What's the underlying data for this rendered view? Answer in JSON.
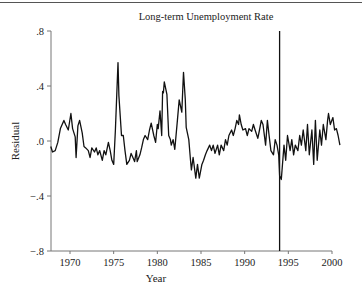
{
  "chart_data": {
    "type": "line",
    "title": "Long-term Unemployment Rate",
    "xlabel": "Year",
    "ylabel": "Residual",
    "xlim": [
      1967.7,
      2001.0
    ],
    "ylim": [
      -0.8,
      0.8
    ],
    "x_ticks": [
      1970,
      1975,
      1980,
      1985,
      1990,
      1995,
      2000
    ],
    "x_tick_labels": [
      "1970",
      "1975",
      "1980",
      "1985",
      "1990",
      "1995",
      "2000"
    ],
    "y_ticks": [
      0.8,
      0.4,
      0.0,
      -0.4,
      -0.8
    ],
    "y_tick_labels": [
      ".8",
      ".4",
      ".0",
      "−.4",
      "−.8"
    ],
    "grid": false,
    "legend": null,
    "annotations": [
      {
        "type": "vertical_line",
        "x": 1994.0,
        "description": "break marker"
      }
    ],
    "series": [
      {
        "name": "Residual",
        "color": "#111111",
        "x": [
          1967.8,
          1968.0,
          1968.3,
          1968.6,
          1968.9,
          1969.3,
          1969.5,
          1969.8,
          1970.1,
          1970.3,
          1970.6,
          1970.7,
          1970.9,
          1971.1,
          1971.4,
          1971.6,
          1971.8,
          1972.1,
          1972.3,
          1972.5,
          1972.8,
          1973.0,
          1973.2,
          1973.4,
          1973.7,
          1973.9,
          1974.1,
          1974.4,
          1974.6,
          1974.8,
          1975.0,
          1975.2,
          1975.5,
          1975.6,
          1975.9,
          1976.1,
          1976.3,
          1976.5,
          1976.8,
          1977.0,
          1977.2,
          1977.4,
          1977.6,
          1977.7,
          1978.0,
          1978.2,
          1978.4,
          1978.6,
          1978.9,
          1979.1,
          1979.3,
          1979.6,
          1979.8,
          1980.0,
          1980.1,
          1980.3,
          1980.5,
          1980.6,
          1980.7,
          1980.8,
          1981.1,
          1981.3,
          1981.5,
          1981.6,
          1981.8,
          1982.0,
          1982.3,
          1982.5,
          1982.8,
          1983.0,
          1983.2,
          1983.3,
          1983.6,
          1983.8,
          1983.9,
          1984.1,
          1984.4,
          1984.6,
          1984.8,
          1985.1,
          1985.3,
          1985.5,
          1985.7,
          1986.0,
          1986.2,
          1986.4,
          1986.6,
          1986.9,
          1987.1,
          1987.3,
          1987.6,
          1987.8,
          1988.0,
          1988.2,
          1988.5,
          1988.7,
          1988.9,
          1989.1,
          1989.3,
          1989.4,
          1989.6,
          1989.8,
          1990.1,
          1990.3,
          1990.5,
          1990.8,
          1991.0,
          1991.2,
          1991.5,
          1991.7,
          1991.9,
          1992.1,
          1992.4,
          1992.6,
          1992.8,
          1993.0,
          1993.3,
          1993.5,
          1993.7,
          1993.9,
          1994.0,
          1994.2,
          1994.5,
          1994.7,
          1994.9,
          1995.2,
          1995.4,
          1995.6,
          1995.8,
          1996.1,
          1996.3,
          1996.5,
          1996.7,
          1997.0,
          1997.2,
          1997.4,
          1997.7,
          1997.9,
          1998.1,
          1998.3,
          1998.6,
          1998.8,
          1999.0,
          1999.3,
          1999.5,
          1999.6,
          1999.8,
          2000.1,
          2000.3,
          2000.5,
          2000.7,
          2000.9
        ],
        "y": [
          -0.04,
          -0.08,
          -0.07,
          -0.01,
          0.09,
          0.15,
          0.12,
          0.08,
          0.2,
          0.09,
          0.03,
          -0.12,
          0.11,
          0.15,
          0.06,
          -0.04,
          -0.05,
          -0.07,
          -0.12,
          -0.05,
          -0.08,
          -0.05,
          -0.1,
          -0.07,
          -0.14,
          -0.07,
          -0.1,
          -0.01,
          -0.07,
          -0.14,
          -0.17,
          0.08,
          0.57,
          0.33,
          0.04,
          0.04,
          -0.07,
          -0.17,
          -0.14,
          -0.09,
          -0.12,
          -0.15,
          -0.07,
          -0.15,
          -0.1,
          -0.05,
          0.01,
          0.04,
          0.01,
          0.08,
          0.13,
          0.04,
          -0.01,
          0.12,
          0.09,
          0.22,
          0.04,
          0.36,
          0.35,
          0.43,
          0.34,
          0.04,
          0.01,
          -0.03,
          0.01,
          -0.06,
          0.15,
          0.3,
          0.21,
          0.5,
          0.3,
          0.1,
          0.01,
          -0.14,
          -0.21,
          -0.12,
          -0.27,
          -0.17,
          -0.27,
          -0.17,
          -0.14,
          -0.1,
          -0.07,
          -0.03,
          -0.07,
          -0.03,
          -0.09,
          -0.03,
          -0.1,
          -0.03,
          -0.07,
          0.01,
          -0.03,
          0.04,
          0.08,
          0.04,
          0.09,
          0.15,
          0.12,
          0.19,
          0.12,
          0.08,
          0.09,
          0.04,
          0.09,
          0.07,
          0.12,
          0.08,
          0.02,
          0.08,
          0.15,
          0.12,
          -0.03,
          0.15,
          0.04,
          -0.07,
          -0.1,
          0.01,
          -0.03,
          -0.1,
          -0.25,
          -0.28,
          -0.03,
          -0.14,
          0.04,
          -0.07,
          0.01,
          -0.1,
          -0.03,
          -0.07,
          0.04,
          -0.03,
          0.08,
          -0.07,
          0.12,
          -0.1,
          0.08,
          -0.17,
          0.15,
          -0.14,
          0.08,
          -0.03,
          0.12,
          0.01,
          0.15,
          0.2,
          0.12,
          0.17,
          0.08,
          0.09,
          0.04,
          -0.03
        ]
      }
    ]
  }
}
